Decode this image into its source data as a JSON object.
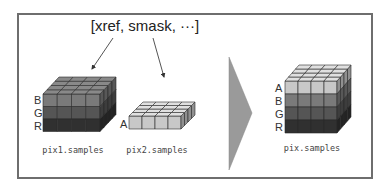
{
  "title": "[xref, smask, ···]",
  "colors": {
    "frame": "#6e6e6e",
    "layer_A": "#c8c8c8",
    "layer_B": "#7a7a7a",
    "layer_G": "#555555",
    "layer_R": "#303030",
    "arrow": "#999999",
    "big_arrow": "#9a9a9a"
  },
  "pix1": {
    "caption": "pix1.samples",
    "layers": [
      "B",
      "G",
      "R"
    ]
  },
  "pix2": {
    "caption": "pix2.samples",
    "layers": [
      "A"
    ]
  },
  "pix": {
    "caption": "pix.samples",
    "layers": [
      "A",
      "B",
      "G",
      "R"
    ]
  },
  "icons": {
    "arrow_left": "arrow-down-left-icon",
    "arrow_right": "arrow-down-right-icon",
    "merge_arrow": "chevron-right-icon"
  }
}
